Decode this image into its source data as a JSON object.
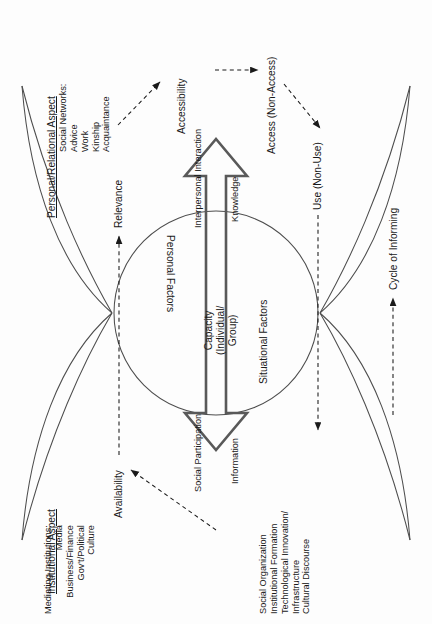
{
  "diagram": {
    "headers": {
      "personal": "Personal/Relational Aspect",
      "institutional": "Institutional Aspect"
    },
    "lists": {
      "social_networks": "Social Networks:\nAdvice\nWork\nKinship\nAcquaintance",
      "mediating_institutions": "Mediating Institutions:\nMedia\nBusiness/Finance\nGov't/Political\nCulture",
      "institutional_outcomes": "Social Organization\nInstitutional Formation\nTechnological Innovation/\nInfrastructure\nCultural Discourse"
    },
    "nodes": {
      "relevance": "Relevance",
      "accessibility": "Accessibility",
      "access": "Access (Non-Access)",
      "use": "Use (Non-Use)",
      "availability": "Availability",
      "cycle": "Cycle of Informing"
    },
    "arrow": {
      "top_left_label": "Interpersonal Interaction",
      "top_right_label": "Knowledge",
      "bottom_left_label": "Social Participation",
      "bottom_right_label": "Information",
      "center_label": "Capacity\n(Individual/\nGroup)"
    },
    "circle": {
      "upper_label": "Personal Factors",
      "lower_label": "Situational Factors"
    },
    "colors": {
      "ink": "#1a1a1a",
      "stroke": "#4d4d4d",
      "arrow_stroke": "#595959",
      "background": "#fdfdfd"
    }
  }
}
